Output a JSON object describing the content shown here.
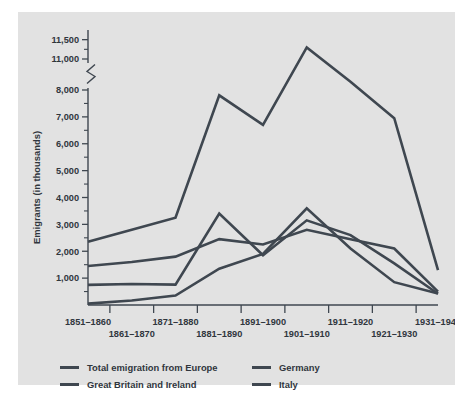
{
  "chart_data": {
    "type": "line",
    "title": "",
    "xlabel": "",
    "ylabel": "Emigrants (in thousands)",
    "categories": [
      "1851–1860",
      "1861–1870",
      "1871–1880",
      "1881–1890",
      "1891–1900",
      "1901–1910",
      "1911–1920",
      "1921–1930",
      "1931–1940"
    ],
    "ytick_labels": [
      "1,000",
      "2,000",
      "3,000",
      "4,000",
      "5,000",
      "6,000",
      "7,000",
      "8,000",
      "11,000",
      "11,500"
    ],
    "ytick_values": [
      1000,
      2000,
      3000,
      4000,
      5000,
      6000,
      7000,
      8000,
      11000,
      11500
    ],
    "yminor_values": [
      500,
      1500,
      2500,
      3500,
      4500,
      5500,
      6500,
      7500,
      11250
    ],
    "ylim": [
      0,
      11750
    ],
    "axis_break": {
      "below": 8000,
      "above": 11000,
      "present": true
    },
    "grid": false,
    "legend_position": "bottom-left",
    "line_color": "#3f4750",
    "series": [
      {
        "name": "Total emigration from Europe",
        "values": [
          2350,
          2800,
          3250,
          7800,
          6700,
          11300,
          8800,
          6950,
          1300
        ]
      },
      {
        "name": "Great Britain and Ireland",
        "values": [
          1450,
          1600,
          1800,
          2450,
          2250,
          2800,
          2450,
          2100,
          500
        ]
      },
      {
        "name": "Germany",
        "values": [
          750,
          780,
          760,
          3400,
          1850,
          3150,
          2600,
          1550,
          420
        ]
      },
      {
        "name": "Italy",
        "values": [
          50,
          170,
          350,
          1350,
          1900,
          3600,
          2100,
          850,
          430
        ]
      }
    ]
  },
  "legend": {
    "entries": [
      "Total emigration from Europe",
      "Germany",
      "Great Britain and Ireland",
      "Italy"
    ]
  }
}
